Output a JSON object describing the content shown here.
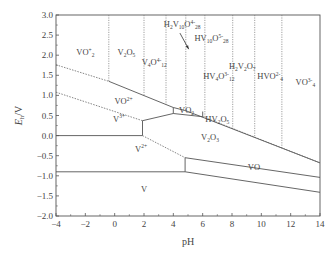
{
  "chart_data": {
    "type": "diagram",
    "title": "",
    "xlabel": "pH",
    "ylabel": "E_h/V",
    "xlim": [
      -4,
      14
    ],
    "ylim": [
      -2.0,
      3.0
    ],
    "x_ticks": [
      "-4",
      "-2",
      "0",
      "2",
      "4",
      "6",
      "8",
      "10",
      "12",
      "14"
    ],
    "y_ticks": [
      "3.0",
      "2.5",
      "2.0",
      "1.5",
      "1.0",
      "0.5",
      "0.0",
      "-0.5",
      "-1.0",
      "-1.5",
      "-2.0"
    ],
    "grid": false,
    "vertical_dotted_boundaries_pH": [
      -0.4,
      2.0,
      3.5,
      4.85,
      6.15,
      8.05,
      9.55,
      11.4
    ],
    "lines": [
      {
        "name": "upper-water-line",
        "style": "dotted",
        "points": [
          [
            -4,
            1.76
          ],
          [
            -0.4,
            1.35
          ]
        ]
      },
      {
        "name": "upper-solid-boundary",
        "style": "solid",
        "points": [
          [
            -0.4,
            1.35
          ],
          [
            4.0,
            0.7
          ],
          [
            4.85,
            0.62
          ],
          [
            14,
            -0.68
          ]
        ]
      },
      {
        "name": "lower-water-line",
        "style": "dotted",
        "points": [
          [
            -4,
            1.08
          ],
          [
            1.9,
            0.37
          ]
        ]
      },
      {
        "name": "V3-V4-solid",
        "style": "solid",
        "points": [
          [
            1.9,
            0.37
          ],
          [
            4.0,
            0.55
          ]
        ]
      },
      {
        "name": "VO2-bottom",
        "style": "solid",
        "points": [
          [
            4.0,
            0.55
          ],
          [
            6.0,
            0.47
          ]
        ]
      },
      {
        "name": "HV2O5-boundary",
        "style": "dotted",
        "points": [
          [
            6.0,
            0.47
          ],
          [
            14,
            -0.68
          ]
        ]
      },
      {
        "name": "V3-V2-horizontal",
        "style": "solid",
        "points": [
          [
            -4,
            0.0
          ],
          [
            1.9,
            0.0
          ]
        ]
      },
      {
        "name": "V3-V2-vertical",
        "style": "solid",
        "points": [
          [
            1.9,
            0.0
          ],
          [
            1.9,
            0.37
          ]
        ]
      },
      {
        "name": "V2O3-V2-dotted",
        "style": "dotted",
        "points": [
          [
            1.9,
            0.0
          ],
          [
            4.8,
            -0.55
          ]
        ]
      },
      {
        "name": "V2-V-horizontal",
        "style": "solid",
        "points": [
          [
            -4,
            -0.9
          ],
          [
            4.8,
            -0.9
          ]
        ]
      },
      {
        "name": "VO-left-vertical",
        "style": "solid",
        "points": [
          [
            4.8,
            -0.9
          ],
          [
            4.8,
            -0.55
          ]
        ]
      },
      {
        "name": "VO-top",
        "style": "solid",
        "points": [
          [
            4.8,
            -0.55
          ],
          [
            14,
            -1.04
          ]
        ]
      },
      {
        "name": "VO-bottom",
        "style": "solid",
        "points": [
          [
            4.8,
            -0.9
          ],
          [
            14,
            -1.41
          ]
        ]
      },
      {
        "name": "VO2-left-edge",
        "style": "solid",
        "points": [
          [
            4.0,
            0.7
          ],
          [
            4.0,
            0.55
          ]
        ]
      },
      {
        "name": "VO2-right-edge",
        "style": "solid",
        "points": [
          [
            6.0,
            0.6
          ],
          [
            6.0,
            0.47
          ]
        ]
      }
    ],
    "regions": [
      {
        "label": "VO2+",
        "main": "VO",
        "sub": "2",
        "sup": "+",
        "pH": -2.0,
        "E": 2.0
      },
      {
        "label": "V2O5",
        "main": "V",
        "sub1": "2",
        "main2": "O",
        "sub": "5",
        "pH": 0.8,
        "E": 2.0
      },
      {
        "label": "V4O12^4-",
        "pH": 2.7,
        "E": 1.75
      },
      {
        "label": "H2V10O28^4-",
        "pH": 4.6,
        "E": 2.7
      },
      {
        "label": "HV10O28^5-",
        "pH": 6.6,
        "E": 2.35
      },
      {
        "label": "HV4O12^3-",
        "pH": 7.1,
        "E": 1.4
      },
      {
        "label": "H2V2O7^2-",
        "pH": 8.7,
        "E": 1.65
      },
      {
        "label": "HVO4^2-",
        "pH": 10.6,
        "E": 1.4
      },
      {
        "label": "VO4^3-",
        "pH": 13.0,
        "E": 1.25
      },
      {
        "label": "VO2+ (vanadyl)",
        "pH": 0.6,
        "E": 0.78
      },
      {
        "label": "VO2",
        "pH": 4.9,
        "E": 0.55
      },
      {
        "label": "HV2O5-",
        "pH": 7.0,
        "E": 0.35
      },
      {
        "label": "V3+",
        "pH": 0.3,
        "E": 0.35
      },
      {
        "label": "V2O3",
        "pH": 6.5,
        "E": -0.1
      },
      {
        "label": "V2+",
        "pH": 1.8,
        "E": -0.4
      },
      {
        "label": "VO",
        "pH": 9.5,
        "E": -0.85
      },
      {
        "label": "V",
        "pH": 2.0,
        "E": -1.4
      }
    ],
    "annotations": [
      {
        "type": "arrow",
        "from_pH": 4.45,
        "from_E": 2.55,
        "to_pH": 5.05,
        "to_E": 2.15,
        "points_to": "H2V10O28 narrow region"
      }
    ]
  },
  "labels": {
    "xlabel": "pH",
    "ylabel_main": "E",
    "ylabel_sub": "h",
    "ylabel_unit": "/V",
    "regions": {
      "vo2plus": {
        "main": "VO",
        "sub": "2",
        "sup": "+"
      },
      "v2o5": {
        "a": "V",
        "a_sub": "2",
        "b": "O",
        "b_sub": "5"
      },
      "v4o12": {
        "a": "V",
        "a_sub": "4",
        "b": "O",
        "b_sup": "4-",
        "b_sub": "12"
      },
      "h2v10o28": {
        "a": "H",
        "a_sub": "2",
        "b": "V",
        "b_sub": "10",
        "c": "O",
        "c_sup": "4-",
        "c_sub": "28"
      },
      "hv10o28": {
        "a": "HV",
        "a_sub": "10",
        "b": "O",
        "b_sup": "5-",
        "b_sub": "28"
      },
      "hv4o12": {
        "a": "HV",
        "a_sub": "4",
        "b": "O",
        "b_sup": "3-",
        "b_sub": "12"
      },
      "h2v2o7": {
        "a": "H",
        "a_sub": "2",
        "b": "V",
        "b_sub": "2",
        "c": "O",
        "c_sub": "7"
      },
      "hvo4": {
        "a": "HVO",
        "a_sup": "2-",
        "a_sub": "4"
      },
      "vo4": {
        "a": "VO",
        "a_sup": "3-",
        "a_sub": "4"
      },
      "vo2plus_ion": {
        "main": "VO",
        "sup": "2+"
      },
      "vo2": {
        "main": "VO",
        "sub": "2"
      },
      "hv2o5": {
        "a": "HV",
        "a_sub": "2",
        "b": "O",
        "b_sub": "5",
        "b_sup": "-"
      },
      "v3plus": {
        "main": "V",
        "sup": "3+"
      },
      "v2o3": {
        "a": "V",
        "a_sub": "2",
        "b": "O",
        "b_sub": "3"
      },
      "v2plus": {
        "main": "V",
        "sup": "2+"
      },
      "vo": {
        "main": "VO"
      },
      "v": {
        "main": "V"
      }
    }
  }
}
